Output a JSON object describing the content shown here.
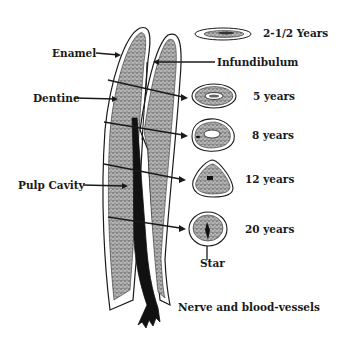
{
  "diagram": {
    "title": "",
    "structure_labels": {
      "enamel": "Enamel",
      "dentine": "Dentine",
      "pulp_cavity": "Pulp Cavity",
      "infundibulum": "Infundibulum",
      "star": "Star",
      "nerve": "Nerve and blood-vessels"
    },
    "cross_sections": [
      {
        "label": "2-1/2 Years",
        "shape": "flat-ellipse"
      },
      {
        "label": "5 years",
        "shape": "oval"
      },
      {
        "label": "8 years",
        "shape": "rounded-oval"
      },
      {
        "label": "12 years",
        "shape": "triangular"
      },
      {
        "label": "20 years",
        "shape": "round"
      }
    ],
    "colors": {
      "ink": "#1a1a1a",
      "dentine_fill": "#9a9a9a",
      "enamel_fill": "#ffffff",
      "pulp": "#111111",
      "background": "#ffffff"
    }
  }
}
